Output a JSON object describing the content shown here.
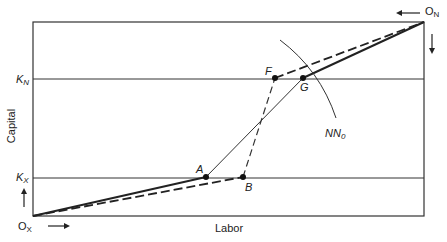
{
  "diagram": {
    "type": "edgeworth-box",
    "x_axis_label": "Labor",
    "y_axis_label": "Capital",
    "origins": {
      "bottom_left": {
        "main": "O",
        "sub": "X"
      },
      "top_right": {
        "main": "O",
        "sub": "N"
      }
    },
    "capital_levels": [
      {
        "main": "K",
        "sub": "N"
      },
      {
        "main": "K",
        "sub": "X"
      }
    ],
    "points": [
      "A",
      "B",
      "F",
      "G"
    ],
    "curve_label": {
      "main": "NN",
      "sub": "0"
    },
    "lines": {
      "solid": "O_X–A–G–O_N",
      "dashed": "O_X–B–F–O_N",
      "thin": "A–G"
    }
  }
}
